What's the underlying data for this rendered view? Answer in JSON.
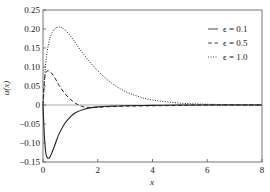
{
  "chart_data": {
    "type": "line",
    "title": "",
    "xlabel": "x",
    "ylabel": "u(x)",
    "xlim": [
      0,
      8
    ],
    "ylim": [
      -0.15,
      0.25
    ],
    "xticks": [
      0,
      2,
      4,
      6,
      8
    ],
    "xtick_labels": [
      "0",
      "2",
      "4",
      "6",
      "8"
    ],
    "yticks": [
      -0.15,
      -0.1,
      -0.05,
      0,
      0.05,
      0.1,
      0.15,
      0.2,
      0.25
    ],
    "ytick_labels": [
      "−0.15",
      "−0.10",
      "−0.05",
      "0",
      "0.05",
      "0.10",
      "0.15",
      "0.20",
      "0.25"
    ],
    "grid": false,
    "legend_position": "top-right",
    "zero_line": true,
    "series": [
      {
        "name": "ϵ = 0.1",
        "style": "solid",
        "x": [
          0,
          0.05,
          0.1,
          0.15,
          0.2,
          0.25,
          0.3,
          0.4,
          0.5,
          0.6,
          0.8,
          1.0,
          1.2,
          1.5,
          2.0,
          2.5,
          3.0,
          4.0,
          5.0,
          6.0,
          8.0
        ],
        "y": [
          0,
          -0.08,
          -0.125,
          -0.138,
          -0.14,
          -0.137,
          -0.13,
          -0.112,
          -0.092,
          -0.074,
          -0.048,
          -0.031,
          -0.02,
          -0.011,
          -0.005,
          -0.003,
          -0.002,
          -0.001,
          0,
          0,
          0
        ]
      },
      {
        "name": "ϵ = 0.5",
        "style": "dashed",
        "x": [
          0,
          0.05,
          0.1,
          0.2,
          0.3,
          0.4,
          0.5,
          0.6,
          0.8,
          1.0,
          1.2,
          1.4,
          1.6,
          2.0,
          2.5,
          3.0,
          4.0,
          5.0,
          6.0,
          8.0
        ],
        "y": [
          0,
          0.06,
          0.085,
          0.09,
          0.085,
          0.075,
          0.063,
          0.05,
          0.03,
          0.015,
          0.004,
          -0.003,
          -0.006,
          -0.006,
          -0.004,
          -0.003,
          -0.002,
          -0.001,
          0,
          0
        ]
      },
      {
        "name": "ϵ = 1.0",
        "style": "dotted",
        "x": [
          0,
          0.1,
          0.2,
          0.3,
          0.4,
          0.5,
          0.6,
          0.7,
          0.8,
          1.0,
          1.2,
          1.5,
          2.0,
          2.5,
          3.0,
          3.5,
          4.0,
          5.0,
          6.0,
          7.0,
          8.0
        ],
        "y": [
          0,
          0.11,
          0.16,
          0.185,
          0.198,
          0.204,
          0.205,
          0.203,
          0.198,
          0.182,
          0.162,
          0.132,
          0.09,
          0.058,
          0.036,
          0.022,
          0.013,
          0.005,
          0.002,
          0.001,
          0
        ]
      }
    ]
  }
}
